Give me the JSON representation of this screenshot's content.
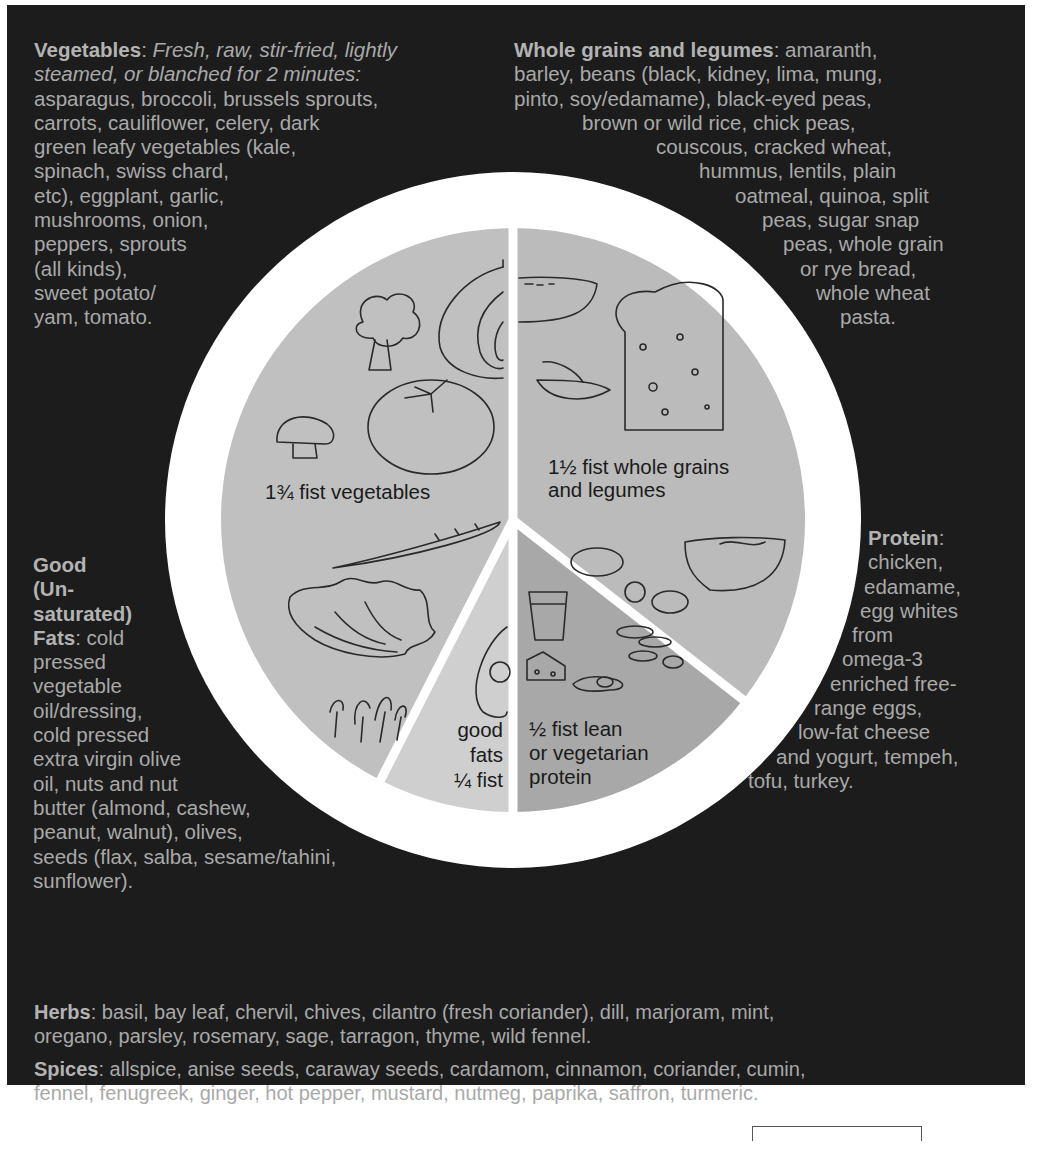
{
  "vegetables": {
    "heading": "Vegetables",
    "method": "Fresh, raw, stir-fried, lightly steamed, or blanched for 2 minutes:",
    "method_lines": [
      "Fresh, raw, stir-fried, lightly",
      "steamed, or blanched for 2 minutes:"
    ],
    "lines": [
      "asparagus, broccoli, brussels sprouts,",
      "carrots, cauliflower, celery, dark",
      "green leafy vegetables (kale,",
      "spinach, swiss chard,",
      "etc), eggplant, garlic,",
      "mushrooms, onion,",
      "peppers, sprouts",
      "(all kinds),",
      "sweet potato/",
      "yam, tomato."
    ]
  },
  "grains": {
    "heading": "Whole grains and legumes",
    "first_line_rest": ": amaranth,",
    "lines": [
      "barley, beans (black, kidney, lima, mung,",
      "pinto, soy/edamame), black-eyed peas,",
      "brown or wild rice, chick peas,",
      "couscous, cracked wheat,",
      "hummus, lentils, plain",
      "oatmeal, quinoa, split",
      "peas, sugar snap",
      "peas, whole grain",
      "or rye bread,",
      "whole wheat",
      "pasta."
    ]
  },
  "fats": {
    "heading_lines": [
      "Good",
      "(Un-",
      "saturated)",
      "Fats"
    ],
    "first_line_rest": ": cold",
    "lines": [
      "pressed",
      "vegetable",
      "oil/dressing,",
      "cold pressed",
      "extra virgin olive",
      "oil, nuts and nut",
      "butter (almond, cashew,",
      "peanut, walnut), olives,",
      "seeds (flax, salba, sesame/tahini,",
      "sunflower)."
    ]
  },
  "protein": {
    "heading": "Protein",
    "heading_suffix": ":",
    "lines": [
      "chicken,",
      "edamame,",
      "egg whites",
      "from",
      "omega-3",
      "enriched free-",
      "range eggs,",
      "low-fat cheese",
      "and yogurt, tempeh,",
      "tofu, turkey."
    ]
  },
  "herbs": {
    "heading": "Herbs",
    "lines": [
      ": basil, bay leaf, chervil, chives, cilantro (fresh coriander), dill, marjoram, mint,",
      "oregano, parsley, rosemary, sage, tarragon, thyme, wild fennel."
    ]
  },
  "spices": {
    "heading": "Spices",
    "lines": [
      ": allspice, anise seeds, caraway seeds, cardamom, cinnamon, coriander, cumin,",
      "fennel, fenugreek, ginger, hot pepper, mustard, nutmeg, paprika, saffron, turmeric."
    ]
  },
  "plate": {
    "segments": [
      {
        "id": "vegetables",
        "label_lines": [
          "1¾ fist vegetables"
        ],
        "portion_fist": 1.75,
        "color": "#c0c0c0"
      },
      {
        "id": "grains",
        "label_lines": [
          "1½ fist whole grains",
          "and legumes"
        ],
        "portion_fist": 1.5,
        "color": "#bbbbbb"
      },
      {
        "id": "protein",
        "label_lines": [
          "½ fist lean",
          "or vegetarian",
          "protein"
        ],
        "portion_fist": 0.5,
        "color": "#a8a8a8"
      },
      {
        "id": "fats",
        "label_lines": [
          "good",
          "fats",
          "¼ fist"
        ],
        "portion_fist": 0.25,
        "color": "#cfcfcf"
      }
    ],
    "illustrations": [
      "onion-icon",
      "broccoli-icon",
      "tomato-icon",
      "mushroom-icon",
      "carrot-icon",
      "lettuce-icon",
      "sprouts-icon",
      "soup-bowl-icon",
      "bread-slice-icon",
      "pea-pod-icon",
      "noodle-bowl-icon",
      "beans-icon",
      "avocado-icon",
      "milk-glass-icon",
      "cheese-icon",
      "egg-icon"
    ]
  },
  "colors": {
    "panel_bg": "#1c1c1c",
    "panel_text": "#a9a9a9",
    "plate_rim": "#ffffff",
    "label_text": "#1a1a1a"
  }
}
